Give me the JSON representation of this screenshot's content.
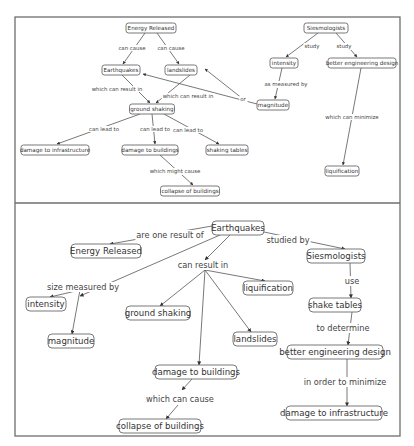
{
  "frame": {
    "x": 15,
    "y": 17,
    "width": 385,
    "height": 419,
    "divider_y": 203
  },
  "maps": [
    {
      "id": "top-map",
      "scale": "small",
      "nodes": [
        {
          "id": "energy",
          "label": "Energy Released",
          "x": 151,
          "y": 28,
          "w": 50,
          "h": 10
        },
        {
          "id": "earthquakes",
          "label": "Earthquakes",
          "x": 121,
          "y": 70,
          "w": 38,
          "h": 10
        },
        {
          "id": "landslides",
          "label": "landslides",
          "x": 181,
          "y": 70,
          "w": 32,
          "h": 10
        },
        {
          "id": "ground",
          "label": "ground shaking",
          "x": 152,
          "y": 109,
          "w": 45,
          "h": 10
        },
        {
          "id": "infra",
          "label": "damage to infrastructure",
          "x": 55,
          "y": 150,
          "w": 68,
          "h": 10
        },
        {
          "id": "buildings",
          "label": "damage to buildings",
          "x": 150,
          "y": 150,
          "w": 56,
          "h": 10
        },
        {
          "id": "tables",
          "label": "shaking tables",
          "x": 227,
          "y": 150,
          "w": 42,
          "h": 10
        },
        {
          "id": "collapse",
          "label": "collapse of buildings",
          "x": 190,
          "y": 191,
          "w": 59,
          "h": 10
        },
        {
          "id": "seismologists",
          "label": "Siesmologists",
          "x": 326,
          "y": 28,
          "w": 44,
          "h": 10
        },
        {
          "id": "intensity",
          "label": "intensity",
          "x": 284,
          "y": 63,
          "w": 28,
          "h": 10
        },
        {
          "id": "engineering",
          "label": "better engineering design",
          "x": 362,
          "y": 63,
          "w": 68,
          "h": 10
        },
        {
          "id": "magnitude",
          "label": "magnitude",
          "x": 273,
          "y": 105,
          "w": 32,
          "h": 10
        },
        {
          "id": "liquification",
          "label": "liquification",
          "x": 342,
          "y": 171,
          "w": 34,
          "h": 10
        }
      ],
      "links": [
        {
          "label": "can cause",
          "lx": 132,
          "ly": 48,
          "from": [
            145,
            33
          ],
          "to": [
            123,
            64
          ]
        },
        {
          "label": "can cause",
          "lx": 171,
          "ly": 48,
          "from": [
            157,
            33
          ],
          "to": [
            179,
            64
          ]
        },
        {
          "label": "which can result in",
          "lx": 117,
          "ly": 89,
          "from": [
            122,
            75
          ],
          "to": [
            150,
            103
          ]
        },
        {
          "label": "which can result in",
          "lx": 188,
          "ly": 96,
          "from": [
            190,
            75
          ],
          "to": [
            156,
            103
          ]
        },
        {
          "label": "or",
          "lx": 243,
          "ly": 99,
          "from": [
            257,
            104
          ],
          "to": [
            143,
            74
          ]
        },
        {
          "label": "",
          "lx": 0,
          "ly": 0,
          "from": [
            243,
            99
          ],
          "to": [
            205,
            69
          ]
        },
        {
          "label": "can lead to",
          "lx": 104,
          "ly": 129,
          "from": [
            140,
            114
          ],
          "to": [
            57,
            144
          ]
        },
        {
          "label": "can lead to",
          "lx": 155,
          "ly": 129,
          "from": [
            152,
            114
          ],
          "to": [
            155,
            144
          ]
        },
        {
          "label": "can lead to",
          "lx": 188,
          "ly": 130,
          "from": [
            164,
            114
          ],
          "to": [
            219,
            144
          ]
        },
        {
          "label": "which might cause",
          "lx": 175,
          "ly": 171,
          "from": [
            160,
            155
          ],
          "to": [
            193,
            185
          ]
        },
        {
          "label": "study",
          "lx": 312,
          "ly": 46,
          "from": [
            318,
            33
          ],
          "to": [
            286,
            57
          ]
        },
        {
          "label": "study",
          "lx": 344,
          "ly": 46,
          "from": [
            336,
            33
          ],
          "to": [
            357,
            57
          ]
        },
        {
          "label": "as measured by",
          "lx": 286,
          "ly": 84,
          "from": [
            282,
            68
          ],
          "to": [
            275,
            99
          ]
        },
        {
          "label": "which can minimize",
          "lx": 352,
          "ly": 117,
          "from": [
            361,
            68
          ],
          "to": [
            343,
            165
          ]
        }
      ]
    },
    {
      "id": "bottom-map",
      "scale": "large",
      "nodes": [
        {
          "id": "earthquakes",
          "label": "Earthquakes",
          "x": 238,
          "y": 228,
          "w": 52,
          "h": 14
        },
        {
          "id": "energy",
          "label": "Energy Released",
          "x": 106,
          "y": 251,
          "w": 70,
          "h": 14
        },
        {
          "id": "seismologists",
          "label": "Siesmologists",
          "x": 336,
          "y": 256,
          "w": 58,
          "h": 14
        },
        {
          "id": "intensity",
          "label": "intensity",
          "x": 46,
          "y": 304,
          "w": 40,
          "h": 14
        },
        {
          "id": "liquification",
          "label": "liquification",
          "x": 268,
          "y": 288,
          "w": 50,
          "h": 14
        },
        {
          "id": "ground",
          "label": "ground shaking",
          "x": 158,
          "y": 313,
          "w": 64,
          "h": 14
        },
        {
          "id": "tables",
          "label": "shake tables",
          "x": 335,
          "y": 305,
          "w": 52,
          "h": 14
        },
        {
          "id": "magnitude",
          "label": "magnitude",
          "x": 71,
          "y": 341,
          "w": 46,
          "h": 14
        },
        {
          "id": "landslides",
          "label": "landslides",
          "x": 255,
          "y": 339,
          "w": 44,
          "h": 14
        },
        {
          "id": "buildings",
          "label": "damage to buildings",
          "x": 196,
          "y": 372,
          "w": 82,
          "h": 14
        },
        {
          "id": "engineering",
          "label": "better engineering design",
          "x": 335,
          "y": 352,
          "w": 96,
          "h": 14
        },
        {
          "id": "infra",
          "label": "damage to infrastructure",
          "x": 334,
          "y": 413,
          "w": 96,
          "h": 14
        },
        {
          "id": "collapse",
          "label": "collapse of buildings",
          "x": 160,
          "y": 426,
          "w": 82,
          "h": 14
        }
      ],
      "links": [
        {
          "label": "are one result of",
          "lx": 170,
          "ly": 235,
          "from": [
            212,
            226
          ],
          "to": [
            110,
            244
          ]
        },
        {
          "label": "",
          "lx": 0,
          "ly": 0,
          "from": [
            220,
            235
          ],
          "to": [
            80,
            296
          ]
        },
        {
          "label": "size measured by",
          "lx": 83,
          "ly": 287,
          "from": [
            80,
            290
          ],
          "to": [
            50,
            297
          ]
        },
        {
          "label": "",
          "lx": 0,
          "ly": 0,
          "from": [
            80,
            290
          ],
          "to": [
            72,
            334
          ]
        },
        {
          "label": "studied by",
          "lx": 288,
          "ly": 240,
          "from": [
            264,
            232
          ],
          "to": [
            345,
            249
          ]
        },
        {
          "label": "can result in",
          "lx": 203,
          "ly": 265,
          "from": [
            230,
            235
          ],
          "to": [
            205,
            260
          ]
        },
        {
          "label": "",
          "lx": 0,
          "ly": 0,
          "from": [
            205,
            270
          ],
          "to": [
            160,
            306
          ]
        },
        {
          "label": "",
          "lx": 0,
          "ly": 0,
          "from": [
            205,
            270
          ],
          "to": [
            265,
            281
          ]
        },
        {
          "label": "",
          "lx": 0,
          "ly": 0,
          "from": [
            205,
            270
          ],
          "to": [
            251,
            332
          ]
        },
        {
          "label": "",
          "lx": 0,
          "ly": 0,
          "from": [
            205,
            270
          ],
          "to": [
            199,
            365
          ]
        },
        {
          "label": "use",
          "lx": 352,
          "ly": 281,
          "from": [
            350,
            263
          ],
          "to": [
            351,
            298
          ]
        },
        {
          "label": "to determine",
          "lx": 343,
          "ly": 328,
          "from": [
            352,
            312
          ],
          "to": [
            348,
            345
          ]
        },
        {
          "label": "in order to minimize",
          "lx": 345,
          "ly": 382,
          "from": [
            347,
            359
          ],
          "to": [
            347,
            406
          ]
        },
        {
          "label": "which can cause",
          "lx": 180,
          "ly": 399,
          "from": [
            192,
            379
          ],
          "to": [
            182,
            390
          ]
        },
        {
          "label": "",
          "lx": 0,
          "ly": 0,
          "from": [
            178,
            405
          ],
          "to": [
            166,
            419
          ]
        }
      ]
    }
  ]
}
